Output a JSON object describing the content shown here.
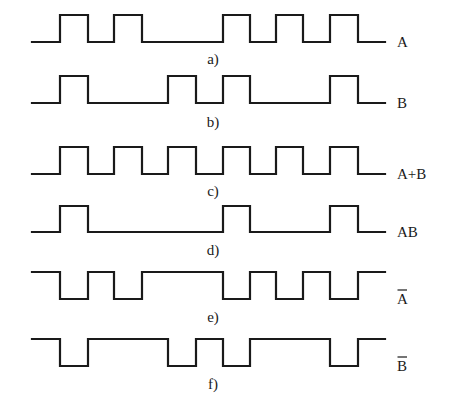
{
  "figure": {
    "x_start": 32,
    "x_end": 385,
    "edges_x": [
      32,
      60,
      88,
      114,
      142,
      168,
      196,
      223,
      250,
      276,
      303,
      330,
      358,
      385
    ],
    "caption_x": 213,
    "label_x": 397,
    "signals": [
      {
        "id": "a",
        "label": "A",
        "overbar": false,
        "caption": "a)",
        "y_high": 15,
        "y_low": 42,
        "caption_y": 64,
        "levels": [
          0,
          1,
          0,
          1,
          0,
          0,
          0,
          1,
          0,
          1,
          0,
          1,
          0
        ]
      },
      {
        "id": "b",
        "label": "B",
        "overbar": false,
        "caption": "b)",
        "y_high": 76,
        "y_low": 103,
        "caption_y": 127,
        "levels": [
          0,
          1,
          0,
          0,
          0,
          1,
          0,
          1,
          0,
          0,
          0,
          1,
          0
        ]
      },
      {
        "id": "c",
        "label": "A+B",
        "overbar": false,
        "caption": "c)",
        "y_high": 147,
        "y_low": 174,
        "caption_y": 196,
        "levels": [
          0,
          1,
          0,
          1,
          0,
          1,
          0,
          1,
          0,
          1,
          0,
          1,
          0
        ]
      },
      {
        "id": "d",
        "label": "AB",
        "overbar": false,
        "caption": "d)",
        "y_high": 206,
        "y_low": 232,
        "caption_y": 255,
        "levels": [
          0,
          1,
          0,
          0,
          0,
          0,
          0,
          1,
          0,
          0,
          0,
          1,
          0
        ]
      },
      {
        "id": "e",
        "label": "A",
        "overbar": true,
        "caption": "e)",
        "y_high": 272,
        "y_low": 299,
        "caption_y": 322,
        "levels": [
          1,
          0,
          1,
          0,
          1,
          1,
          1,
          0,
          1,
          0,
          1,
          0,
          1
        ]
      },
      {
        "id": "f",
        "label": "B",
        "overbar": true,
        "caption": "f)",
        "y_high": 339,
        "y_low": 366,
        "caption_y": 389,
        "levels": [
          1,
          0,
          1,
          1,
          1,
          0,
          1,
          0,
          1,
          1,
          1,
          0,
          1
        ]
      }
    ]
  }
}
